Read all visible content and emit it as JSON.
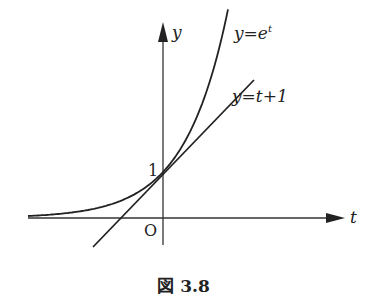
{
  "figure": {
    "caption": "図 3.8",
    "axes": {
      "x_label": "t",
      "y_label": "y",
      "origin_label": "O",
      "y_tick_label": "1"
    },
    "curves": [
      {
        "name": "exponential",
        "label": "y = e^t",
        "label_text": "y=e",
        "label_sup": "t"
      },
      {
        "name": "tangent-line",
        "label": "y = t + 1",
        "label_text": "y=t+1"
      }
    ],
    "colors": {
      "ink": "#222222",
      "background": "#ffffff"
    }
  }
}
